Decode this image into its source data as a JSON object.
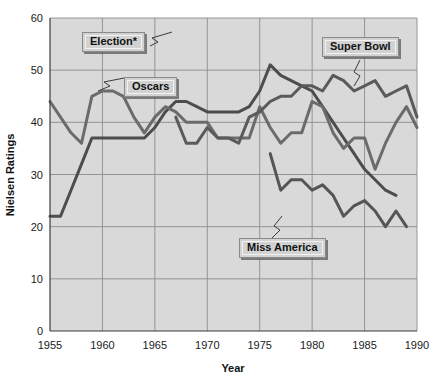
{
  "chart_data": {
    "type": "line",
    "title": "",
    "xlabel": "Year",
    "ylabel": "Nielsen Ratings",
    "xlim": [
      1955,
      1990
    ],
    "ylim": [
      0,
      60
    ],
    "xticks": [
      1955,
      1960,
      1965,
      1970,
      1975,
      1980,
      1985,
      1990
    ],
    "yticks": [
      0,
      10,
      20,
      30,
      40,
      50,
      60
    ],
    "grid": true,
    "legend_position": "inline-callouts",
    "x": [
      1955,
      1956,
      1957,
      1958,
      1959,
      1960,
      1961,
      1962,
      1963,
      1964,
      1965,
      1966,
      1967,
      1968,
      1969,
      1970,
      1971,
      1972,
      1973,
      1974,
      1975,
      1976,
      1977,
      1978,
      1979,
      1980,
      1981,
      1982,
      1983,
      1984,
      1985,
      1986,
      1987,
      1988,
      1989,
      1990
    ],
    "series": [
      {
        "name": "Election*",
        "color": "#4d4d4d",
        "values": [
          22,
          22,
          27,
          32,
          37,
          37,
          37,
          37,
          37,
          37,
          39,
          42,
          44,
          44,
          43,
          42,
          42,
          42,
          42,
          43,
          46,
          51,
          49,
          48,
          47,
          46,
          43,
          40,
          37,
          34,
          31,
          29,
          27,
          26,
          null,
          null
        ]
      },
      {
        "name": "Oscars",
        "color": "#6b6b6b",
        "values": [
          44,
          41,
          38,
          36,
          45,
          46,
          46,
          45,
          41,
          38,
          41,
          43,
          42,
          40,
          40,
          40,
          37,
          37,
          37,
          37,
          43,
          39,
          36,
          38,
          38,
          44,
          43,
          38,
          35,
          37,
          37,
          31,
          36,
          40,
          43,
          39
        ]
      },
      {
        "name": "Super Bowl",
        "color": "#5a5a5a",
        "values": [
          null,
          null,
          null,
          null,
          null,
          null,
          null,
          null,
          null,
          null,
          null,
          null,
          41,
          36,
          36,
          39,
          37,
          37,
          36,
          41,
          42,
          44,
          45,
          45,
          47,
          47,
          46,
          49,
          48,
          46,
          47,
          48,
          45,
          46,
          47,
          41
        ]
      },
      {
        "name": "Miss America",
        "color": "#555555",
        "values": [
          null,
          null,
          null,
          null,
          null,
          null,
          null,
          null,
          null,
          null,
          null,
          null,
          null,
          null,
          null,
          null,
          null,
          null,
          null,
          null,
          null,
          34,
          27,
          29,
          29,
          27,
          28,
          26,
          22,
          24,
          25,
          23,
          20,
          23,
          20,
          null
        ]
      }
    ],
    "callouts": [
      {
        "label": "Election*",
        "x_px": 82,
        "y_px": 32
      },
      {
        "label": "Oscars",
        "x_px": 124,
        "y_px": 77
      },
      {
        "label": "Super Bowl",
        "x_px": 322,
        "y_px": 37
      },
      {
        "label": "Miss America",
        "x_px": 239,
        "y_px": 238
      }
    ]
  },
  "axes": {
    "y_label": "Nielsen Ratings",
    "x_label": "Year",
    "x_tick_labels": [
      "1955",
      "1960",
      "1965",
      "1970",
      "1975",
      "1980",
      "1985",
      "1990"
    ],
    "y_tick_labels": [
      "0",
      "10",
      "20",
      "30",
      "40",
      "50",
      "60"
    ]
  },
  "style": {
    "plot_background": "#d9d9d9",
    "grid_color": "#8c8c8c",
    "page_background": "#ffffff"
  }
}
